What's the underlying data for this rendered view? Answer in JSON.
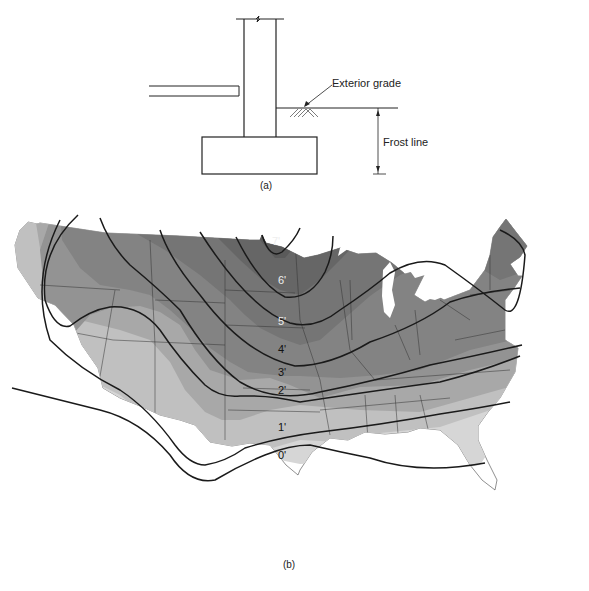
{
  "figure_a": {
    "caption": "(a)",
    "labels": {
      "exterior_grade": "Exterior grade",
      "frost_line": "Frost line"
    }
  },
  "figure_b": {
    "caption": "(b)",
    "contours": [
      {
        "label": "7'",
        "depth_ft": 7,
        "color": "#5a5a5a"
      },
      {
        "label": "6'",
        "depth_ft": 6,
        "color": "#6a6a6a"
      },
      {
        "label": "5'",
        "depth_ft": 5,
        "color": "#777777"
      },
      {
        "label": "4'",
        "depth_ft": 4,
        "color": "#858585"
      },
      {
        "label": "3'",
        "depth_ft": 3,
        "color": "#959595"
      },
      {
        "label": "2'",
        "depth_ft": 2,
        "color": "#a8a8a8"
      },
      {
        "label": "1'",
        "depth_ft": 1,
        "color": "#bcbcbc"
      },
      {
        "label": "0'",
        "depth_ft": 0,
        "color": "#d4d4d4"
      }
    ]
  }
}
